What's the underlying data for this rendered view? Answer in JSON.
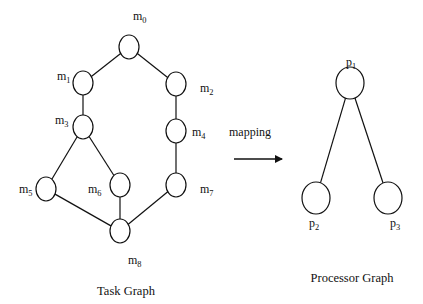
{
  "task_graph": {
    "title": "Task Graph",
    "nodes": [
      {
        "id": "m0",
        "label": "m",
        "sub": "0",
        "cx": 129,
        "cy": 47,
        "lx": 133,
        "ly": 20
      },
      {
        "id": "m1",
        "label": "m",
        "sub": "1",
        "cx": 83,
        "cy": 83,
        "lx": 57,
        "ly": 80
      },
      {
        "id": "m2",
        "label": "m",
        "sub": "2",
        "cx": 176,
        "cy": 84,
        "lx": 200,
        "ly": 92
      },
      {
        "id": "m3",
        "label": "m",
        "sub": "3",
        "cx": 83,
        "cy": 127,
        "lx": 55,
        "ly": 124
      },
      {
        "id": "m4",
        "label": "m",
        "sub": "4",
        "cx": 176,
        "cy": 131,
        "lx": 192,
        "ly": 136
      },
      {
        "id": "m5",
        "label": "m",
        "sub": "5",
        "cx": 46,
        "cy": 189,
        "lx": 19,
        "ly": 193
      },
      {
        "id": "m6",
        "label": "m",
        "sub": "6",
        "cx": 120,
        "cy": 185,
        "lx": 88,
        "ly": 193
      },
      {
        "id": "m7",
        "label": "m",
        "sub": "7",
        "cx": 176,
        "cy": 185,
        "lx": 200,
        "ly": 193
      },
      {
        "id": "m8",
        "label": "m",
        "sub": "8",
        "cx": 120,
        "cy": 231,
        "lx": 128,
        "ly": 264
      }
    ],
    "edges": [
      [
        "m0",
        "m1"
      ],
      [
        "m0",
        "m2"
      ],
      [
        "m1",
        "m3"
      ],
      [
        "m2",
        "m4"
      ],
      [
        "m3",
        "m5"
      ],
      [
        "m3",
        "m6"
      ],
      [
        "m4",
        "m7"
      ],
      [
        "m5",
        "m8"
      ],
      [
        "m6",
        "m8"
      ],
      [
        "m7",
        "m8"
      ]
    ]
  },
  "mapping": {
    "label": "mapping"
  },
  "processor_graph": {
    "title": "Processor Graph",
    "nodes": [
      {
        "id": "p1",
        "label": "p",
        "sub": "1",
        "cx": 350,
        "cy": 83,
        "lx": 346,
        "ly": 66
      },
      {
        "id": "p2",
        "label": "p",
        "sub": "2",
        "cx": 316,
        "cy": 198,
        "lx": 309,
        "ly": 227
      },
      {
        "id": "p3",
        "label": "p",
        "sub": "3",
        "cx": 388,
        "cy": 198,
        "lx": 390,
        "ly": 227
      }
    ],
    "edges": [
      [
        "p1",
        "p2"
      ],
      [
        "p1",
        "p3"
      ]
    ]
  }
}
